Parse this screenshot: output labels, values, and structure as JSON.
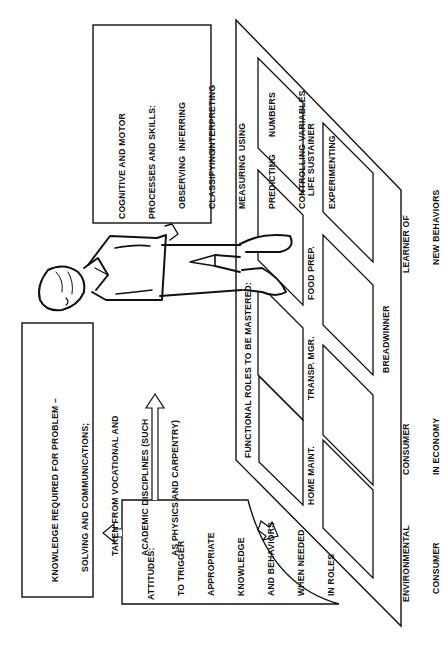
{
  "cognitive_box": {
    "title_line1": "COGNITIVE AND MOTOR",
    "title_line2": "PROCESSES AND SKILLS:",
    "skills_col1": [
      "OBSERVING",
      "CLASSIFYING",
      "MEASURING",
      "PREDICTING"
    ],
    "skills_col2": [
      "INFERRING",
      "INTERPRETING",
      "USING",
      "NUMBERS"
    ],
    "skill_wide1": "CONTROLLING VARIABLES",
    "skill_wide2": "EXPERIMENTING"
  },
  "knowledge_box": {
    "line1": "KNOWLEDGE REQUIRED FOR PROBLEM –",
    "line2": "SOLVING AND COMMUNICATIONS;",
    "line3": "TAKEN FROM VOCATIONAL AND",
    "line4": "ACADEMIC DISCIPLINES (SUCH",
    "line5": "AS PHYSICS AND CARPENTRY)"
  },
  "attitudes_box": {
    "line1": "ATTITUDES:",
    "line2": "TO TRIGGER",
    "line3": "APPROPRIATE",
    "line4": "KNOWLEDGE",
    "line5": "AND BEHAVIORS",
    "line6": "WHEN NEEDED",
    "line7": "IN ROLES"
  },
  "floor": {
    "header": "FUNCTIONAL ROLES TO BE MASTERED:",
    "row1": [
      "HOME MAINT.",
      "TRANSP. MGR.",
      "FOOD PREP.",
      "LIFE SUSTAINER"
    ],
    "row2": [
      {
        "line1": "ENVIRONMENTAL",
        "line2": "CONSUMER"
      },
      {
        "line1": "CONSUMER",
        "line2": "IN ECONOMY"
      },
      {
        "line1": "BREADWINNER",
        "line2": ""
      },
      {
        "line1": "LEARNER OF",
        "line2": "NEW BEHAVIORS"
      }
    ]
  },
  "icons": {
    "arrow_up": "hollow-arrow-up",
    "arrow_left": "hollow-arrow-left",
    "arrow_diag": "hollow-arrow-diagonal",
    "person": "student-figure"
  }
}
